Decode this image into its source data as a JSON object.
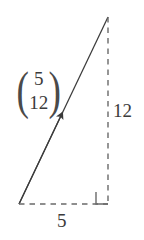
{
  "figure": {
    "type": "geometry-diagram",
    "background_color": "#ffffff",
    "stroke_color": "#4a4a4a",
    "text_color": "#3b3b3b",
    "vector_label": {
      "open_bracket": "(",
      "close_bracket": ")",
      "components": [
        "5",
        "12"
      ]
    },
    "labels": {
      "vertical_leg": "12",
      "horizontal_leg": "5"
    },
    "geometry": {
      "apex": [
        108,
        17
      ],
      "bottom_left": [
        19,
        204
      ],
      "bottom_right": [
        108,
        204
      ],
      "right_angle_marker": true,
      "arrow_tip": [
        62,
        100
      ]
    }
  }
}
